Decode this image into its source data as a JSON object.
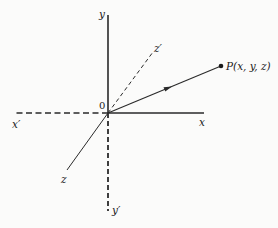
{
  "diagram": {
    "type": "3d-coordinate-axes",
    "origin": {
      "label": "0",
      "x": 108,
      "y": 113
    },
    "axes": [
      {
        "name": "y",
        "label": "y",
        "style": "solid",
        "end": [
          108,
          15
        ],
        "label_pos": [
          99,
          18
        ]
      },
      {
        "name": "y-prime",
        "label": "y′",
        "style": "dashed",
        "end": [
          108,
          211
        ],
        "label_pos": [
          113,
          214
        ]
      },
      {
        "name": "x",
        "label": "x",
        "style": "solid",
        "end": [
          204,
          113
        ],
        "label_pos": [
          199,
          126
        ]
      },
      {
        "name": "x-prime",
        "label": "x′",
        "style": "dashed",
        "end": [
          13,
          113
        ],
        "label_pos": [
          12,
          127
        ]
      },
      {
        "name": "z-prime",
        "label": "z′",
        "style": "dashed",
        "end": [
          153,
          52
        ],
        "label_pos": [
          155,
          50
        ]
      },
      {
        "name": "z",
        "label": "z",
        "style": "solid",
        "end": [
          67,
          170
        ],
        "label_pos": [
          61,
          183
        ]
      }
    ],
    "point": {
      "label": "P(x, y, z)",
      "position": [
        221,
        66
      ],
      "label_pos": [
        226,
        70
      ]
    },
    "vector": {
      "from": [
        108,
        113
      ],
      "to": [
        221,
        66
      ],
      "arrow_at": [
        168,
        88
      ]
    },
    "colors": {
      "line": "#2a2a2a",
      "text": "#1a1a1a",
      "background": "#fbfbfa"
    }
  }
}
